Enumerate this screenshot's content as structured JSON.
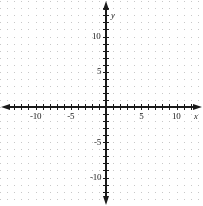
{
  "chart_data": {
    "type": "scatter",
    "title": "",
    "subtitle": "",
    "xlabel": "x",
    "ylabel": "y",
    "xlim": [
      -14,
      14
    ],
    "ylim": [
      -14,
      14
    ],
    "grid": true,
    "grid_style": "dotted-lattice",
    "legend": null,
    "series": [],
    "x": [],
    "values": [],
    "annotations": [],
    "axis_arrows": [
      "left",
      "right",
      "up",
      "down"
    ],
    "tick_interval": 1,
    "label_interval": 5,
    "x_tick_labels": [
      "-10",
      "-5",
      "5",
      "10"
    ],
    "x_tick_values": [
      -10,
      -5,
      5,
      10
    ],
    "y_tick_labels": [
      "10",
      "5",
      "-5",
      "-10"
    ],
    "y_tick_values": [
      10,
      5,
      -5,
      -10
    ],
    "origin_px": [
      106,
      107
    ],
    "unit_px": 7.05
  },
  "colors": {
    "background": "#ffffff",
    "axis": "#1a1a1a",
    "grid_dot": "#c8c8c8",
    "label_text": "#1a1a1a"
  },
  "axis_names": {
    "x": "x",
    "y": "y"
  },
  "x_labels": [
    {
      "text": "-10",
      "value": -10
    },
    {
      "text": "-5",
      "value": -5
    },
    {
      "text": "5",
      "value": 5
    },
    {
      "text": "10",
      "value": 10
    }
  ],
  "y_labels": [
    {
      "text": "10",
      "value": 10
    },
    {
      "text": "5",
      "value": 5
    },
    {
      "text": "-5",
      "value": -5
    },
    {
      "text": "-10",
      "value": -10
    }
  ]
}
